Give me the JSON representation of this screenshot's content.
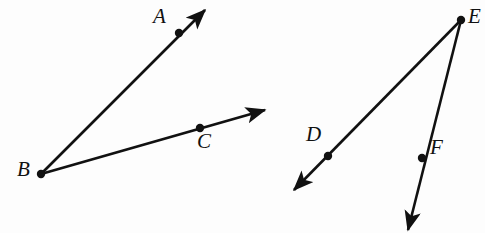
{
  "figure": {
    "background_color": "#fdfdfd",
    "stroke_color": "#111111",
    "stroke_width": 2.6,
    "point_radius": 4.2,
    "canvas": {
      "width": 485,
      "height": 233
    }
  },
  "labels": {
    "a": "A",
    "b": "B",
    "c": "C",
    "d": "D",
    "e": "E",
    "f": "F"
  },
  "label_positions": {
    "a": {
      "x": 153,
      "y": 6
    },
    "b": {
      "x": 17,
      "y": 159
    },
    "c": {
      "x": 197,
      "y": 131
    },
    "d": {
      "x": 306,
      "y": 124
    },
    "e": {
      "x": 468,
      "y": 6
    },
    "f": {
      "x": 430,
      "y": 137
    }
  },
  "geometry": {
    "angle_abc": {
      "vertex": {
        "name": "B",
        "x": 41,
        "y": 174
      },
      "rays": [
        {
          "name": "ray-ba",
          "from": {
            "x": 41,
            "y": 174
          },
          "to": {
            "x": 205,
            "y": 10
          },
          "arrow": true,
          "point": {
            "name": "A",
            "x": 179,
            "y": 33
          }
        },
        {
          "name": "ray-bc",
          "from": {
            "x": 41,
            "y": 174
          },
          "to": {
            "x": 265,
            "y": 110
          },
          "arrow": true,
          "point": {
            "name": "C",
            "x": 200,
            "y": 128
          }
        }
      ]
    },
    "angle_def": {
      "vertex": {
        "name": "E",
        "x": 461,
        "y": 20
      },
      "rays": [
        {
          "name": "ray-ed",
          "from": {
            "x": 461,
            "y": 20
          },
          "to": {
            "x": 294,
            "y": 190
          },
          "arrow": true,
          "point": {
            "name": "D",
            "x": 328,
            "y": 156
          }
        },
        {
          "name": "ray-ef",
          "from": {
            "x": 461,
            "y": 20
          },
          "to": {
            "x": 408,
            "y": 230
          },
          "arrow": true,
          "point": {
            "name": "F",
            "x": 422,
            "y": 158
          }
        }
      ]
    }
  }
}
